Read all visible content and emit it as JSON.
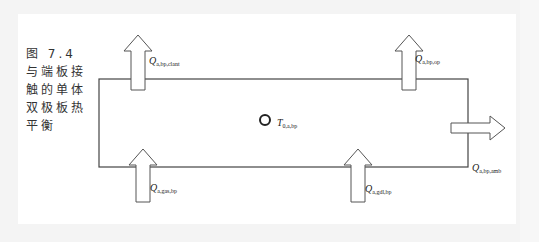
{
  "caption": {
    "lines": [
      "图 7.4",
      "与端板接",
      "触的单体",
      "双极板热",
      "平衡"
    ]
  },
  "labels": {
    "q_clant": {
      "main": "Q",
      "sub": "a,bp,clant"
    },
    "q_op": {
      "main": "Q",
      "sub": "a,bp,op"
    },
    "t_center": {
      "main": "T",
      "sub": "0,a,bp"
    },
    "q_gas": {
      "main": "Q",
      "sub": "a,gas,bp"
    },
    "q_gdl": {
      "main": "Q",
      "sub": "a,gdl,bp"
    },
    "q_amb": {
      "main": "Q",
      "sub": "a,bp,amb"
    }
  },
  "colors": {
    "line": "#444444",
    "arrow_fill": "#ffffff",
    "background": "#f4f4f4"
  }
}
